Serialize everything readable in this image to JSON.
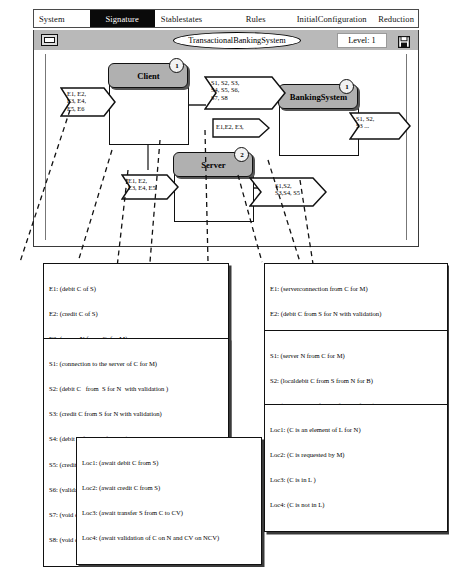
{
  "menubar": {
    "items": [
      {
        "label": "System",
        "selected": false
      },
      {
        "label": "Signature",
        "selected": true
      },
      {
        "label": "Stablestates",
        "selected": false
      },
      {
        "label": "Rules",
        "selected": false
      },
      {
        "label": "InitialConfiguration",
        "selected": false
      },
      {
        "label": "Reduction",
        "selected": false
      }
    ]
  },
  "titlebar": {
    "title": "TransactionalBankingSystem",
    "level": "Level: 1",
    "window_button": "window-restore-icon",
    "save_button": "save-disk-icon"
  },
  "diagram": {
    "agents": [
      {
        "name": "Client",
        "badge": "1"
      },
      {
        "name": "Server",
        "badge": "2"
      },
      {
        "name": "BankingSystem",
        "badge": "1"
      }
    ],
    "signals": [
      {
        "id": "client-in",
        "text": "E1, E2,\nE3, E4,\nE5, E6"
      },
      {
        "id": "client-out",
        "text": "S1, S2, S3,\nS4, S5, S6,\nS7, S8"
      },
      {
        "id": "bank-in",
        "text": "E1,E2, E3,"
      },
      {
        "id": "bank-out",
        "text": "S1, S2,\nS3 ..."
      },
      {
        "id": "server-in",
        "text": "E1, E2,\nE3, E4, E5"
      },
      {
        "id": "server-out",
        "text": "S1,S2,\nS3,S4, S5"
      }
    ]
  },
  "legends": {
    "e_left": {
      "title": "events-client",
      "lines": [
        "E1: (debit C of S)",
        "E2: (credit C of S)",
        "E3: (server N from  C  for M)",
        "E4: (transfer  S  from C  to CV)",
        "E5: (end transaction on C for M of P)",
        "E6: (error on C for M)"
      ]
    },
    "e_right": {
      "title": "events-banking",
      "lines": [
        "E1: (serverconnection from C for M)",
        "E2: (debit C from S for N with validation)",
        "E3: (credit C from S for N with validation)  -",
        "E4: (debit C from S for N)",
        "E5: (credit C from S for  N )"
      ]
    },
    "s_left": {
      "title": "signals-client",
      "lines": [
        "S1: (connection to the server of C for M)",
        "S2: (debit C   from  S for N  with validation )",
        "S3: (credit C from S for N with validation)",
        "S4: (debit C from  S  for  NC)",
        "S5: (credit C from  S  for NC)",
        "S6: (validate C from M for PC)",
        "S7: (void debit C for PC)",
        "S8: (void credit C for PC)"
      ]
    },
    "s_right": {
      "title": "signals-banking",
      "lines": [
        "S1: (server N from C for M)",
        "S2: (localdebit C from S from N for B)",
        "S3: (localcredit C from S from N for B)",
        "S4: (predebit C from S from N for B)",
        "S5: (precredit C from S from N for B)"
      ]
    },
    "loc_left": {
      "title": "locations-client",
      "lines": [
        "Loc1: (await debit C from S)",
        "Loc2: (await credit C from S)",
        "Loc3: (await transfer S from C to CV)",
        "Loc4: (await validation of C on N and CV on NCV)"
      ]
    },
    "loc_right": {
      "title": "locations-banking",
      "lines": [
        "Loc1: (C is an element of L for N)",
        "Loc2: (C is requested by M)",
        "Loc3: (C is in L )",
        "Loc4: (C is not in L)"
      ]
    }
  }
}
